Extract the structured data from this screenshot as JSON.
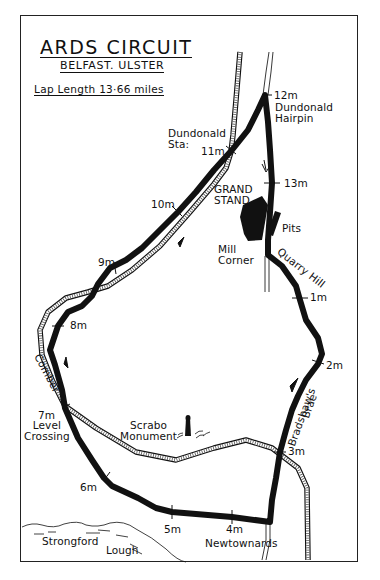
{
  "header": {
    "title": "ARDS CIRCUIT",
    "subtitle": "BELFAST. ULSTER",
    "lap_length": "Lap Length  13·66 miles"
  },
  "colors": {
    "track": "#111111",
    "background": "#ffffff",
    "ink": "#111111"
  },
  "map": {
    "mile_markers": [
      {
        "label": "1m"
      },
      {
        "label": "2m"
      },
      {
        "label": "3m"
      },
      {
        "label": "4m"
      },
      {
        "label": "5m"
      },
      {
        "label": "6m"
      },
      {
        "label": "7m"
      },
      {
        "label": "8m"
      },
      {
        "label": "9m"
      },
      {
        "label": "10m"
      },
      {
        "label": "11m"
      },
      {
        "label": "12m"
      },
      {
        "label": "13m"
      }
    ],
    "places": {
      "dundonald_hairpin_1": "Dundonald",
      "dundonald_hairpin_2": "Hairpin",
      "dundonald_sta_1": "Dundonald",
      "dundonald_sta_2": "Sta:",
      "grand_stand_1": "GRAND",
      "grand_stand_2": "STAND",
      "pits": "Pits",
      "mill_corner_1": "Mill",
      "mill_corner_2": "Corner",
      "quarry_hill": "Quarry Hill",
      "comber": "Comber",
      "level_crossing_1": "Level",
      "level_crossing_2": "Crossing",
      "scrabo_1": "Scrabo",
      "scrabo_2": "Monument",
      "bradshaws_brae_1": "Bradshaw's",
      "bradshaws_brae_2": "Brae",
      "newtownards": "Newtownards",
      "lough_1": "Strongford",
      "lough_2": "Lough"
    }
  }
}
